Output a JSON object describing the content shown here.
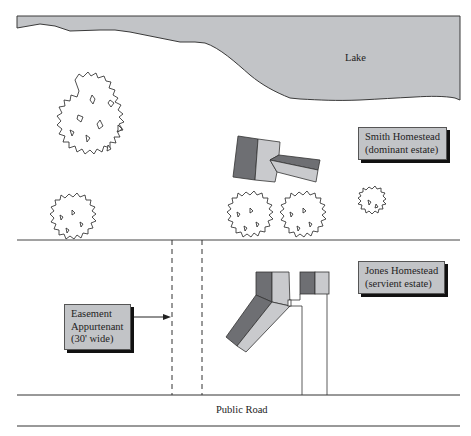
{
  "diagram": {
    "colors": {
      "lake_fill": "#c2c4c7",
      "house_dark": "#6e6f73",
      "house_light": "#c9cacd",
      "callout_fill": "#c2c4c7",
      "line": "#333333"
    },
    "lake": {
      "label": "Lake"
    },
    "callouts": {
      "smith": {
        "line1": "Smith Homestead",
        "line2": "(dominant estate)"
      },
      "jones": {
        "line1": "Jones Homestead",
        "line2": "(servient estate)"
      },
      "easement": {
        "line1": "Easement",
        "line2": "Appurtenant",
        "line3": "(30' wide)"
      }
    },
    "road": {
      "label": "Public Road"
    },
    "elements": [
      "lake",
      "smith-house",
      "jones-house",
      "jones-garage",
      "large-tree",
      "tree-left",
      "tree-center-1",
      "tree-center-2",
      "small-tree",
      "property-line",
      "easement-dashed-lines",
      "driveway",
      "public-road"
    ]
  }
}
